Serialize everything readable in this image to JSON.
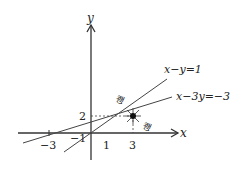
{
  "axes": {
    "x_label": "x",
    "y_label": "y"
  },
  "ticks": {
    "x_neg3": "−3",
    "x_1": "1",
    "x_3": "3",
    "y_neg1": "−1",
    "y_2": "2"
  },
  "lines": {
    "line1": "x−y=1",
    "line2": "x−3y=−3"
  },
  "stamps": {
    "upper": "쾡",
    "lower": "쾡"
  },
  "intersection": {
    "x": 3,
    "y": 2
  }
}
